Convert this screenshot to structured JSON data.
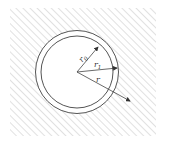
{
  "diagram": {
    "labels": {
      "r0": {
        "base": "r",
        "sub": "0"
      },
      "r1": {
        "base": "r",
        "sub": "1"
      },
      "r": {
        "base": "r",
        "sub": ""
      }
    },
    "colors": {
      "line": "#555555",
      "hatch": "#c8c8c8",
      "background": "#ffffff"
    }
  }
}
